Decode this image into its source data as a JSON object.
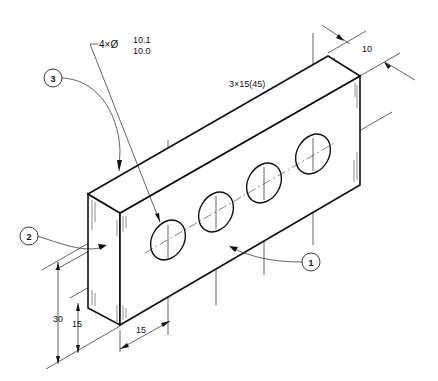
{
  "drawing": {
    "type": "isometric technical drawing",
    "part": "rectangular block with 4 through holes"
  },
  "dimensions": {
    "hole_callout_count": "4×Ø",
    "hole_tolerance_upper": "10.1",
    "hole_tolerance_lower": "10.0",
    "hole_spacing": "3×15(45)",
    "thickness": "10",
    "height_total": "30",
    "height_hole_center": "15",
    "edge_to_first_hole": "15"
  },
  "balloons": [
    {
      "label": "1"
    },
    {
      "label": "2"
    },
    {
      "label": "3"
    }
  ]
}
